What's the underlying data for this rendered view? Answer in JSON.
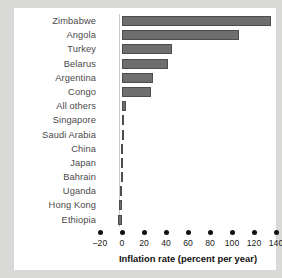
{
  "chart_data": {
    "type": "bar",
    "orientation": "horizontal",
    "title": "",
    "xlabel": "Inflation rate (percent per year)",
    "ylabel": "",
    "xlim": [
      -20,
      140
    ],
    "xticks": [
      -20,
      0,
      20,
      40,
      60,
      80,
      100,
      120,
      140
    ],
    "xtick_labels": [
      "–20",
      "0",
      "20",
      "40",
      "60",
      "80",
      "100",
      "120",
      "140"
    ],
    "grid": false,
    "legend": null,
    "bar_color": "#6e6e6e",
    "categories": [
      "Zimbabwe",
      "Angola",
      "Turkey",
      "Belarus",
      "Argentina",
      "Congo",
      "All others",
      "Singapore",
      "Saudi Arabia",
      "China",
      "Japan",
      "Bahrain",
      "Uganda",
      "Hong Kong",
      "Ethiopia"
    ],
    "values": [
      135,
      106,
      45,
      42,
      28,
      26,
      4,
      0,
      0,
      -0.8,
      -1,
      -1.2,
      -1.7,
      -2.5,
      -4
    ]
  },
  "axis": {
    "title": "Inflation rate (percent per year)"
  }
}
